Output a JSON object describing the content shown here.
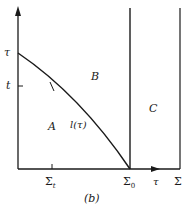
{
  "diagram": {
    "caption": "(b)",
    "regions": {
      "A": "A",
      "B": "B",
      "C": "C"
    },
    "curve_label": "l(τ)",
    "y_axis": {
      "top_label": "τ",
      "tick_label": "t"
    },
    "x_axis": {
      "tick_sigma_t": {
        "base": "Σ",
        "sub": "t"
      },
      "sigma_0": {
        "base": "Σ",
        "sub": "0"
      },
      "arrow_label": "τ",
      "end_label": "Σ"
    },
    "colors": {
      "line": "#1a1a1a",
      "background": "#ffffff"
    }
  }
}
